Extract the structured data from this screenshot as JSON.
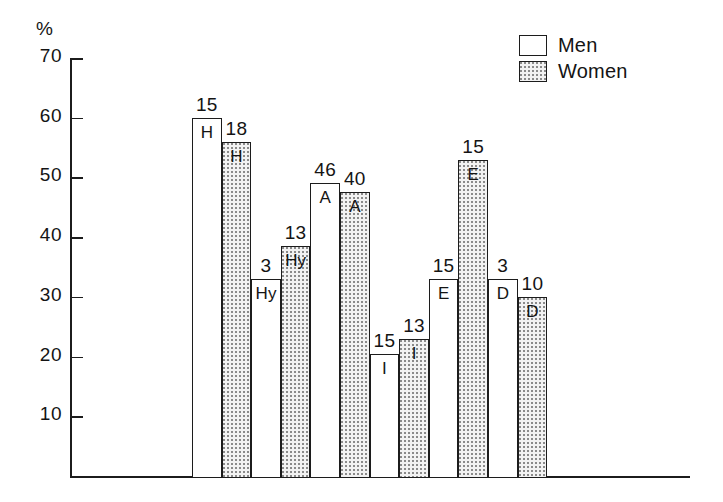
{
  "chart_data": {
    "type": "bar",
    "title": "",
    "subtitle": "",
    "xlabel": "",
    "ylabel": "%",
    "ylim": [
      0,
      70
    ],
    "ytick_labels": [
      "70",
      "60",
      "50",
      "40",
      "30",
      "20",
      "10"
    ],
    "ytick_values": [
      70,
      60,
      50,
      40,
      30,
      20,
      10
    ],
    "grid": false,
    "legend_position": "top-right",
    "categories": [
      "H",
      "Hy",
      "A",
      "I",
      "E",
      "D"
    ],
    "legend": [
      "Men",
      "Women"
    ],
    "series": [
      {
        "name": "Men",
        "fill": "white",
        "values": [
          60,
          33,
          49,
          20.5,
          33,
          33
        ],
        "labels": [
          "15",
          "3",
          "46",
          "15",
          "15",
          "3"
        ],
        "codes": [
          "H",
          "Hy",
          "A",
          "I",
          "E",
          "D"
        ]
      },
      {
        "name": "Women",
        "fill": "stippled",
        "values": [
          56,
          38.5,
          47.5,
          23,
          53,
          30
        ],
        "labels": [
          "18",
          "13",
          "40",
          "13",
          "15",
          "10"
        ],
        "codes": [
          "H",
          "Hy",
          "A",
          "I",
          "E",
          "D"
        ]
      }
    ]
  },
  "axis": {
    "unit_label": "%"
  },
  "legend": {
    "items": [
      {
        "label": "Men",
        "fill": "men"
      },
      {
        "label": "Women",
        "fill": "women"
      }
    ]
  },
  "colors": {
    "ink": "#1c1c1c",
    "stipple": "#8a8a8a",
    "men_fill": "#ffffff",
    "women_fill": "#f2f2f2"
  }
}
